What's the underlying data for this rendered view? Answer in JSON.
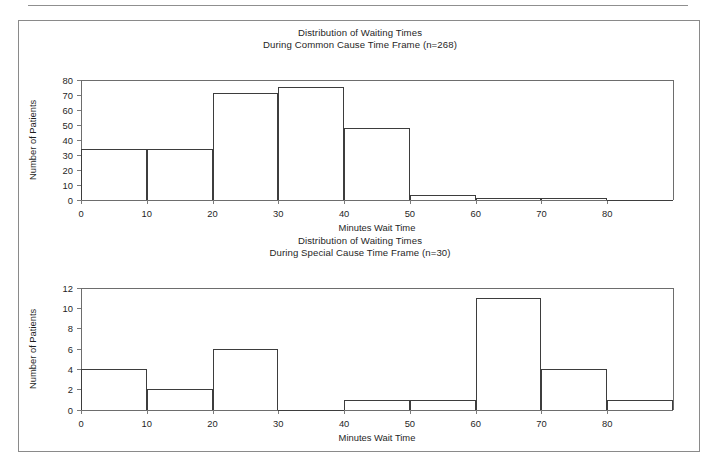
{
  "figure": {
    "background": "#ffffff",
    "line_color": "#3d3d3d",
    "axis_color": "#6d6d6d"
  },
  "chart_data": [
    {
      "type": "bar",
      "id": "common-cause-histogram",
      "title_line1": "Distribution of Waiting Times",
      "title_line2": "During Common Cause Time Frame (n=268)",
      "xlabel": "Minutes Wait Time",
      "ylabel": "Number of Patients",
      "xlim": [
        0,
        90
      ],
      "ylim": [
        0,
        80
      ],
      "xticks": [
        0,
        10,
        20,
        30,
        40,
        50,
        60,
        70,
        80
      ],
      "yticks": [
        0,
        10,
        20,
        30,
        40,
        50,
        60,
        70,
        80
      ],
      "grid": false,
      "legend": "none",
      "bin_width": 10,
      "bin_edges": [
        0,
        10,
        20,
        30,
        40,
        50,
        60,
        70,
        80,
        90
      ],
      "categories": [
        "0-10",
        "10-20",
        "20-30",
        "30-40",
        "40-50",
        "50-60",
        "60-70",
        "70-80",
        "80-90"
      ],
      "values": [
        34,
        34,
        71,
        75,
        48,
        3,
        1,
        1,
        0
      ]
    },
    {
      "type": "bar",
      "id": "special-cause-histogram",
      "title_line1": "Distribution of Waiting Times",
      "title_line2": "During Special Cause Time Frame (n=30)",
      "xlabel": "Minutes Wait Time",
      "ylabel": "Number of Patients",
      "xlim": [
        0,
        90
      ],
      "ylim": [
        0,
        12
      ],
      "xticks": [
        0,
        10,
        20,
        30,
        40,
        50,
        60,
        70,
        80
      ],
      "yticks": [
        0,
        2,
        4,
        6,
        8,
        10,
        12
      ],
      "grid": false,
      "legend": "none",
      "bin_width": 10,
      "bin_edges": [
        0,
        10,
        20,
        30,
        40,
        50,
        60,
        70,
        80,
        90
      ],
      "categories": [
        "0-10",
        "10-20",
        "20-30",
        "30-40",
        "40-50",
        "50-60",
        "60-70",
        "70-80",
        "80-90"
      ],
      "values": [
        4,
        2,
        6,
        0,
        1,
        1,
        11,
        4,
        1
      ]
    }
  ]
}
